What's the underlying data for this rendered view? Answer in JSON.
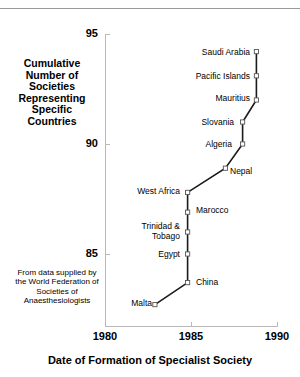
{
  "figure": {
    "top_rule": "horizontal-rule"
  },
  "chart_data": {
    "type": "line",
    "title": "",
    "xlabel": "Date of Formation of Specialist Society",
    "ylabel": "Cumulative Number of Societies Representing Specific Countries",
    "xlim": [
      1980,
      1990
    ],
    "ylim": [
      82,
      95
    ],
    "xticks": [
      1980,
      1985,
      1990
    ],
    "xtick_labels": [
      "1980",
      "1985",
      "1990"
    ],
    "yticks": [
      85,
      90,
      95
    ],
    "ytick_labels": [
      "85",
      "90",
      "95"
    ],
    "grid": false,
    "legend": null,
    "marker": "open-square",
    "line_color": "#1a1a1a",
    "axis_color": "#b9b9b9",
    "x": [
      1982.9,
      1984.8,
      1984.8,
      1984.8,
      1984.8,
      1984.8,
      1987.0,
      1988.0,
      1988.0,
      1988.8,
      1988.8,
      1988.8
    ],
    "y": [
      82.7,
      83.7,
      85.0,
      86.0,
      86.9,
      87.8,
      88.9,
      90.0,
      91.0,
      92.0,
      93.1,
      94.2
    ],
    "point_labels": [
      "Malta",
      "China",
      "Egypt",
      "Trinidad &\nTobago",
      "Marocco",
      "West Africa",
      "Nepal",
      "Algeria",
      "Slovania",
      "Mauritius",
      "Pacific Islands",
      "Saudi Arabia"
    ],
    "annotation": "From data supplied by the World Federation of Societies of Anaesthesiologists"
  },
  "axis_titles": {
    "y": "Cumulative\nNumber of\nSocieties\nRepresenting\nSpecific\nCountries",
    "x": "Date of Formation of Specialist Society"
  },
  "footnote": "From data\nsupplied by\nthe World\nFederation\nof Societies of\nAnaesthesiologists",
  "labels": {
    "malta": "Malta",
    "china": "China",
    "egypt": "Egypt",
    "trinidad": "Trinidad &\nTobago",
    "marocco": "Marocco",
    "west_africa": "West Africa",
    "nepal": "Nepal",
    "algeria": "Algeria",
    "slovania": "Slovania",
    "mauritius": "Mauritius",
    "pacific_islands": "Pacific Islands",
    "saudi_arabia": "Saudi Arabia"
  },
  "ytick_labels": {
    "t95": "95",
    "t90": "90",
    "t85": "85"
  },
  "xtick_labels": {
    "t1980": "1980",
    "t1985": "1985",
    "t1990": "1990"
  }
}
